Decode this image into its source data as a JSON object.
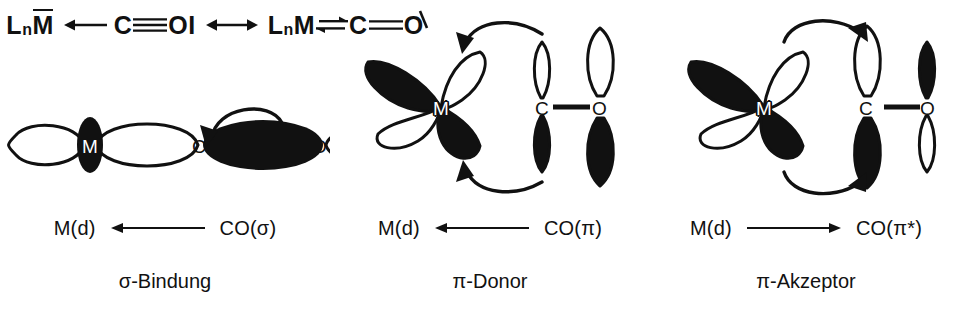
{
  "figure": {
    "language": "de",
    "background_color": "#ffffff",
    "ink_color": "#111111",
    "filled_lobe_color": "#111111",
    "empty_lobe_color": "#ffffff"
  },
  "resonance": {
    "left_structure": {
      "metal": "L",
      "metal_sub": "n",
      "metal_symbol": "M",
      "metal_overbar": true,
      "arrow": "donation-arrow-left",
      "carbon": "C",
      "bond": "triple-bond",
      "oxygen": "O",
      "oxygen_lone_pair": "I"
    },
    "resonance_arrow": "double-headed-arrow",
    "right_structure": {
      "metal": "L",
      "metal_sub": "n",
      "metal_symbol": "M",
      "arrow": "double-harpoon",
      "carbon": "C",
      "bond": "double-bond",
      "oxygen": "O",
      "oxygen_lone_pair": "slash"
    }
  },
  "panels": [
    {
      "id": "sigma",
      "title": "σ-Bindung",
      "donation": {
        "left_label": "M(d)",
        "arrow": "arrow-left",
        "arrow_direction": "left",
        "right_label": "CO(σ)"
      },
      "orbitals": {
        "metal": {
          "atom": "M",
          "type": "dz2",
          "lobes": [
            {
              "position": "left",
              "phase": "empty"
            },
            {
              "position": "right",
              "phase": "empty"
            },
            {
              "position": "center-torus",
              "phase": "filled"
            }
          ]
        },
        "carbon": {
          "atom": "C",
          "type": "sp-lone-pair",
          "lobes": [
            {
              "position": "right",
              "phase": "filled"
            }
          ]
        },
        "oxygen": {
          "atom": "O",
          "type": "sp-lone-pair",
          "lobes": [
            {
              "position": "right",
              "phase": "empty"
            }
          ]
        }
      },
      "curved_arrows": [
        {
          "from": "carbon-lobe",
          "to": "metal",
          "path": "over-top",
          "direction": "right-to-left"
        }
      ]
    },
    {
      "id": "pi-donor",
      "title": "π-Donor",
      "donation": {
        "left_label": "M(d)",
        "arrow": "arrow-left",
        "arrow_direction": "left",
        "right_label": "CO(π)"
      },
      "orbitals": {
        "metal": {
          "atom": "M",
          "type": "d-orbital-four-lobe",
          "lobes": [
            {
              "position": "upper-left",
              "phase": "filled"
            },
            {
              "position": "upper-right",
              "phase": "empty"
            },
            {
              "position": "lower-left",
              "phase": "empty"
            },
            {
              "position": "lower-right",
              "phase": "filled"
            }
          ]
        },
        "carbon": {
          "atom": "C",
          "type": "p-orbital",
          "size": "small",
          "lobes": [
            {
              "position": "top",
              "phase": "empty"
            },
            {
              "position": "bottom",
              "phase": "filled"
            }
          ]
        },
        "oxygen": {
          "atom": "O",
          "type": "p-orbital",
          "size": "large",
          "lobes": [
            {
              "position": "top",
              "phase": "empty"
            },
            {
              "position": "bottom",
              "phase": "filled"
            }
          ]
        },
        "co_bond": "single-line"
      },
      "curved_arrows": [
        {
          "from": "carbon-top-lobe",
          "to": "metal-upper-right",
          "path": "over-top",
          "direction": "right-to-left"
        },
        {
          "from": "carbon-bottom-lobe",
          "to": "metal-lower-right",
          "path": "under-bottom",
          "direction": "right-to-left"
        }
      ]
    },
    {
      "id": "pi-acceptor",
      "title": "π-Akzeptor",
      "donation": {
        "left_label": "M(d)",
        "arrow": "arrow-right",
        "arrow_direction": "right",
        "right_label": "CO(π*)"
      },
      "orbitals": {
        "metal": {
          "atom": "M",
          "type": "d-orbital-four-lobe",
          "lobes": [
            {
              "position": "upper-left",
              "phase": "filled"
            },
            {
              "position": "upper-right",
              "phase": "empty"
            },
            {
              "position": "lower-left",
              "phase": "empty"
            },
            {
              "position": "lower-right",
              "phase": "filled"
            }
          ]
        },
        "carbon": {
          "atom": "C",
          "type": "p-orbital",
          "size": "large",
          "lobes": [
            {
              "position": "top",
              "phase": "empty"
            },
            {
              "position": "bottom",
              "phase": "filled"
            }
          ]
        },
        "oxygen": {
          "atom": "O",
          "type": "p-orbital",
          "size": "small",
          "lobes": [
            {
              "position": "top",
              "phase": "filled"
            },
            {
              "position": "bottom",
              "phase": "empty"
            }
          ]
        },
        "co_bond": "single-line"
      },
      "curved_arrows": [
        {
          "from": "metal-upper-right",
          "to": "carbon-top-lobe",
          "path": "over-top",
          "direction": "left-to-right"
        },
        {
          "from": "metal-lower-right",
          "to": "carbon-bottom-lobe",
          "path": "under-bottom",
          "direction": "left-to-right"
        }
      ]
    }
  ]
}
